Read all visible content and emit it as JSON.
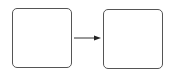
{
  "diagram": {
    "nodes": [
      {
        "id": "box-left",
        "label": "",
        "x": 12,
        "y": 8,
        "w": 60,
        "h": 60
      },
      {
        "id": "box-right",
        "label": "",
        "x": 103,
        "y": 9,
        "w": 60,
        "h": 60
      }
    ],
    "edges": [
      {
        "from": "box-left",
        "to": "box-right",
        "label": ""
      }
    ],
    "colors": {
      "stroke": "#555555",
      "arrow": "#333333"
    }
  }
}
